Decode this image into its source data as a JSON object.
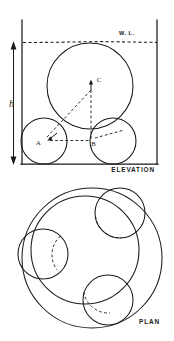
{
  "figure": {
    "views": [
      {
        "key": "elevation",
        "label": "ELEVATION"
      },
      {
        "key": "plan",
        "label": "PLAN"
      }
    ]
  },
  "elevation": {
    "view_label": "ELEVATION",
    "water_line_label": "W. L.",
    "height_dimension_label": "h",
    "points": [
      {
        "id": "A",
        "label": "A",
        "x": 44,
        "y": 140,
        "role": "left-small-circle-center"
      },
      {
        "id": "B",
        "label": "B",
        "x": 102,
        "y": 140,
        "role": "right-small-circle-center"
      },
      {
        "id": "C",
        "label": "C",
        "x": 94,
        "y": 85,
        "role": "large-circle-center"
      }
    ],
    "circles": [
      {
        "id": "large",
        "cx": 90,
        "cy": 86,
        "r": 43,
        "style": "solid",
        "role": "upper-sphere"
      },
      {
        "id": "small-left",
        "cx": 44,
        "cy": 141,
        "r": 23,
        "style": "solid",
        "role": "lower-sphere-left"
      },
      {
        "id": "small-right",
        "cx": 113,
        "cy": 141,
        "r": 23,
        "style": "solid",
        "role": "lower-sphere-right"
      }
    ],
    "frame": {
      "left_x": 22,
      "right_x": 157,
      "top_y": 20,
      "bottom_y": 164
    },
    "water_line": {
      "y": 42,
      "from_x": 24,
      "to_x": 157,
      "style": "dashed"
    },
    "construction_lines": [
      {
        "from": "A",
        "to": "C",
        "style": "dashed"
      },
      {
        "from": "C",
        "to": "B",
        "style": "dashed"
      },
      {
        "from": "A",
        "to": "B",
        "style": "dashed"
      },
      {
        "from": "B",
        "to": "right-tangent",
        "style": "dashed"
      }
    ],
    "dimension": {
      "label": "h",
      "axis": "vertical",
      "x": 28,
      "top_y": 42,
      "bottom_y": 164,
      "arrow_both_ends": true
    }
  },
  "plan": {
    "view_label": "PLAN",
    "circles": [
      {
        "id": "outer",
        "cx": 92,
        "cy": 258,
        "r": 70,
        "style": "solid",
        "role": "outer-boundary"
      },
      {
        "id": "inner-large",
        "cx": 85,
        "cy": 250,
        "r": 54,
        "style": "solid",
        "role": "upper-sphere-projection"
      },
      {
        "id": "small-top-right",
        "cx": 120,
        "cy": 213,
        "r": 25,
        "style": "solid",
        "role": "lower-sphere-1"
      },
      {
        "id": "small-left",
        "cx": 43,
        "cy": 254,
        "r": 25,
        "style": "solid",
        "role": "lower-sphere-2"
      },
      {
        "id": "small-bottom",
        "cx": 108,
        "cy": 300,
        "r": 25,
        "style": "solid",
        "role": "lower-sphere-3"
      }
    ],
    "hidden_arcs": [
      {
        "id": "arc-top-right",
        "cx": 120,
        "cy": 213,
        "r": 25,
        "style": "dashed",
        "role": "hidden-contact-arc-1"
      },
      {
        "id": "arc-left",
        "cx": 43,
        "cy": 254,
        "r": 25,
        "style": "dashed",
        "role": "hidden-contact-arc-2"
      },
      {
        "id": "arc-bottom",
        "cx": 108,
        "cy": 300,
        "r": 25,
        "style": "dashed",
        "role": "hidden-contact-arc-3"
      }
    ]
  },
  "colors": {
    "ink": "#1a1a1a",
    "background": "#ffffff"
  }
}
